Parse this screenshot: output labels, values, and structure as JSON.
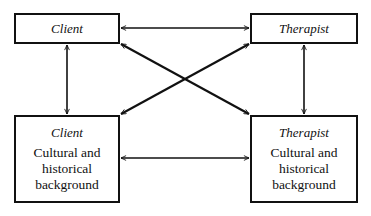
{
  "diagram": {
    "boxes": {
      "client_top": {
        "title": "Client"
      },
      "therapist_top": {
        "title": "Therapist"
      },
      "client_bottom": {
        "title": "Client",
        "desc_lines": [
          "Cultural and",
          "historical",
          "background"
        ]
      },
      "therapist_bottom": {
        "title": "Therapist",
        "desc_lines": [
          "Cultural and",
          "historical",
          "background"
        ]
      }
    },
    "connections": [
      {
        "from": "client_top",
        "to": "therapist_top",
        "type": "bidirectional"
      },
      {
        "from": "client_bottom",
        "to": "therapist_bottom",
        "type": "bidirectional"
      },
      {
        "from": "client_top",
        "to": "client_bottom",
        "type": "bidirectional"
      },
      {
        "from": "therapist_top",
        "to": "therapist_bottom",
        "type": "bidirectional"
      },
      {
        "from": "client_top",
        "to": "therapist_bottom",
        "type": "bidirectional"
      },
      {
        "from": "therapist_top",
        "to": "client_bottom",
        "type": "bidirectional"
      }
    ],
    "colors": {
      "line": "#111111",
      "background": "#ffffff"
    }
  }
}
